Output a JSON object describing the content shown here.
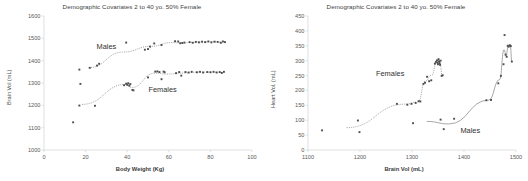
{
  "figure": {
    "panels": [
      "left",
      "right"
    ]
  },
  "chart_data": [
    {
      "type": "scatter",
      "id": "brain-vol-vs-body-weight",
      "title": "Demographic Covariates 2 to 40 yo. 50% Female",
      "xlabel": "Body Weight (Kg)",
      "ylabel": "Brain Vol (mL)",
      "xlim": [
        0,
        100
      ],
      "ylim": [
        1000,
        1600
      ],
      "xticks": [
        0,
        20,
        40,
        60,
        80,
        100
      ],
      "yticks": [
        1000,
        1100,
        1200,
        1300,
        1400,
        1500,
        1600
      ],
      "grid": false,
      "legend": "annotations-on-plot",
      "annotations": [
        {
          "text": "Males",
          "x": 30,
          "y": 1452
        },
        {
          "text": "Females",
          "x": 57,
          "y": 1258
        }
      ],
      "series": [
        {
          "name": "Males",
          "trendline": "dotted-logarithmic",
          "points": [
            [
              17.0,
              1360
            ],
            [
              22.0,
              1368
            ],
            [
              25.5,
              1378
            ],
            [
              26.5,
              1386
            ],
            [
              39.5,
              1481
            ],
            [
              48.5,
              1449
            ],
            [
              50.0,
              1452
            ],
            [
              51.0,
              1463
            ],
            [
              53.0,
              1477
            ],
            [
              56.5,
              1470
            ],
            [
              63.0,
              1487
            ],
            [
              64.5,
              1486
            ],
            [
              65.5,
              1478
            ],
            [
              66.5,
              1479
            ],
            [
              67.5,
              1481
            ],
            [
              70.0,
              1483
            ],
            [
              71.5,
              1480
            ],
            [
              73.0,
              1484
            ],
            [
              74.5,
              1482
            ],
            [
              76.0,
              1485
            ],
            [
              77.5,
              1483
            ],
            [
              79.0,
              1486
            ],
            [
              80.5,
              1482
            ],
            [
              82.0,
              1485
            ],
            [
              83.5,
              1484
            ],
            [
              85.0,
              1480
            ],
            [
              86.0,
              1486
            ],
            [
              87.0,
              1483
            ]
          ]
        },
        {
          "name": "Females",
          "trendline": "dotted-logarithmic",
          "points": [
            [
              14.0,
              1124
            ],
            [
              17.0,
              1199
            ],
            [
              17.5,
              1296
            ],
            [
              24.5,
              1198
            ],
            [
              38.5,
              1290
            ],
            [
              39.5,
              1297
            ],
            [
              40.0,
              1292
            ],
            [
              40.5,
              1299
            ],
            [
              41.0,
              1288
            ],
            [
              41.5,
              1295
            ],
            [
              42.5,
              1269
            ],
            [
              43.0,
              1267
            ],
            [
              50.0,
              1325
            ],
            [
              53.5,
              1351
            ],
            [
              54.5,
              1352
            ],
            [
              55.5,
              1349
            ],
            [
              56.5,
              1317
            ],
            [
              57.5,
              1351
            ],
            [
              58.0,
              1348
            ],
            [
              63.5,
              1344
            ],
            [
              65.0,
              1349
            ],
            [
              66.0,
              1333
            ],
            [
              68.0,
              1349
            ],
            [
              69.5,
              1347
            ],
            [
              71.0,
              1350
            ],
            [
              73.5,
              1348
            ],
            [
              75.0,
              1350
            ],
            [
              76.5,
              1347
            ],
            [
              78.5,
              1349
            ],
            [
              80.0,
              1348
            ],
            [
              81.5,
              1350
            ],
            [
              83.0,
              1347
            ],
            [
              84.5,
              1349
            ],
            [
              85.5,
              1345
            ],
            [
              86.5,
              1350
            ]
          ]
        }
      ]
    },
    {
      "type": "scatter",
      "id": "heart-vol-vs-brain-vol",
      "title": "Demographic Covariates 2 to 40 yo. 50% Female",
      "xlabel": "Brain Vol (mL)",
      "ylabel": "Heart Vol. (mL)",
      "xlim": [
        1100,
        1500
      ],
      "ylim": [
        0,
        450
      ],
      "xticks": [
        1100,
        1200,
        1300,
        1400,
        1500
      ],
      "yticks": [
        0,
        50,
        100,
        150,
        200,
        250,
        300,
        350,
        400,
        450
      ],
      "grid": false,
      "legend": "annotations-on-plot",
      "annotations": [
        {
          "text": "Females",
          "x": 1258,
          "y": 248
        },
        {
          "text": "Males",
          "x": 1412,
          "y": 58
        }
      ],
      "series": [
        {
          "name": "Females",
          "trendline": "dotted-exponential",
          "points": [
            [
              1127,
              66
            ],
            [
              1196,
              99
            ],
            [
              1199,
              60
            ],
            [
              1271,
              155
            ],
            [
              1291,
              152
            ],
            [
              1299,
              155
            ],
            [
              1307,
              158
            ],
            [
              1313,
              164
            ],
            [
              1316,
              163
            ],
            [
              1322,
              222
            ],
            [
              1325,
              226
            ],
            [
              1329,
              246
            ],
            [
              1333,
              231
            ],
            [
              1337,
              234
            ],
            [
              1344,
              290
            ],
            [
              1346,
              296
            ],
            [
              1348,
              301
            ],
            [
              1349,
              293
            ],
            [
              1350,
              288
            ],
            [
              1351,
              305
            ],
            [
              1352,
              298
            ],
            [
              1353,
              292
            ],
            [
              1354,
              286
            ],
            [
              1355,
              300
            ],
            [
              1357,
              249
            ],
            [
              1359,
              251
            ]
          ]
        },
        {
          "name": "Males",
          "trendline": "solid-quadratic",
          "points": [
            [
              1302,
              90
            ],
            [
              1355,
              102
            ],
            [
              1361,
              70
            ],
            [
              1381,
              105
            ],
            [
              1443,
              167
            ],
            [
              1452,
              168
            ],
            [
              1466,
              224
            ],
            [
              1471,
              249
            ],
            [
              1476,
              288
            ],
            [
              1478,
              386
            ],
            [
              1480,
              320
            ],
            [
              1482,
              313
            ],
            [
              1484,
              350
            ],
            [
              1486,
              347
            ],
            [
              1488,
              352
            ],
            [
              1490,
              349
            ],
            [
              1492,
              297
            ]
          ]
        }
      ]
    }
  ]
}
